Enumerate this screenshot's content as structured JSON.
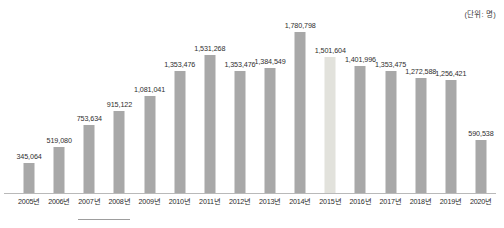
{
  "unit_note": "(단위: 명)",
  "chart_data": {
    "type": "bar",
    "title": "",
    "subtitle": "",
    "xlabel": "",
    "ylabel": "",
    "unit": "명",
    "grid": false,
    "legend": "none",
    "ylim": [
      0,
      1780798
    ],
    "categories": [
      "2005년",
      "2006년",
      "2007년",
      "2008년",
      "2009년",
      "2010년",
      "2011년",
      "2012년",
      "2013년",
      "2014년",
      "2015년",
      "2016년",
      "2017년",
      "2018년",
      "2019년",
      "2020년"
    ],
    "values": [
      345064,
      519080,
      753634,
      915122,
      1081041,
      1353476,
      1531268,
      1353476,
      1384549,
      1780798,
      1501604,
      1401996,
      1353475,
      1272588,
      1256421,
      590538
    ],
    "value_labels": [
      "345,064",
      "519,080",
      "753,634",
      "915,122",
      "1,081,041",
      "1,353,476",
      "1,531,268",
      "1,353,476",
      "1,384,549",
      "1,780,798",
      "1,501,604",
      "1,401,996",
      "1,353,475",
      "1,272,588",
      "1,256,421",
      "590,538"
    ],
    "bar_color": "#a8a8a8",
    "highlight_color": "#e2e2dc",
    "highlight_index": 10
  }
}
